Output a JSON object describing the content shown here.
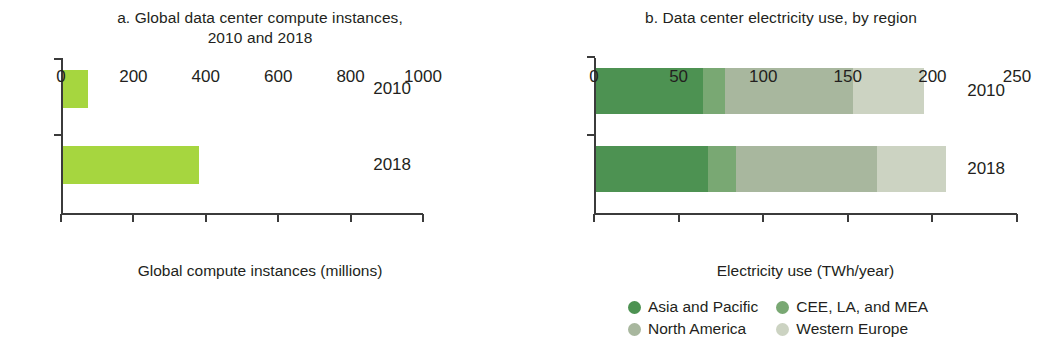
{
  "chart_data": [
    {
      "type": "bar",
      "panel": "a",
      "title": "a. Global data center compute instances,\n2010 and 2018",
      "orientation": "horizontal",
      "categories": [
        "2010",
        "2018"
      ],
      "values": [
        68,
        375
      ],
      "series_name": "Global compute instances",
      "color": "#a6d63f",
      "xlabel": "Global compute instances (millions)",
      "ylabel": "",
      "xlim": [
        0,
        1000
      ],
      "xticks": [
        0,
        200,
        400,
        600,
        800,
        1000
      ],
      "xtick_labels": [
        "0",
        "200",
        "400",
        "600",
        "800",
        "1000"
      ],
      "grid": false,
      "legend": false
    },
    {
      "type": "bar",
      "panel": "b",
      "title": "b. Data center electricity use, by region",
      "orientation": "horizontal",
      "stacked": true,
      "categories": [
        "2010",
        "2018"
      ],
      "series": [
        {
          "name": "Asia and Pacific",
          "values": [
            63,
            66
          ],
          "color": "#4d9252"
        },
        {
          "name": "CEE, LA, and MEA",
          "values": [
            13,
            17
          ],
          "color": "#79a873"
        },
        {
          "name": "North America",
          "values": [
            76,
            83
          ],
          "color": "#a8b79e"
        },
        {
          "name": "Western Europe",
          "values": [
            42,
            41
          ],
          "color": "#ccd3c2"
        }
      ],
      "totals": [
        194,
        207
      ],
      "xlabel": "Electricity use (TWh/year)",
      "ylabel": "",
      "xlim": [
        0,
        250
      ],
      "xticks": [
        0,
        50,
        100,
        150,
        200,
        250
      ],
      "xtick_labels": [
        "0",
        "50",
        "100",
        "150",
        "200",
        "250"
      ],
      "grid": false,
      "legend": true,
      "legend_position": "bottom",
      "legend_entries": [
        "Asia and Pacific",
        "CEE, LA, and MEA",
        "North America",
        "Western Europe"
      ]
    }
  ],
  "panel_a": {
    "title": "a. Global data center compute instances,\n2010 and 2018",
    "axis_title": "Global compute instances (millions)",
    "category_labels": [
      "2010",
      "2018"
    ],
    "tick_labels": [
      "0",
      "200",
      "400",
      "600",
      "800",
      "1000"
    ]
  },
  "panel_b": {
    "title": "b. Data center electricity use, by region",
    "axis_title": "Electricity use (TWh/year)",
    "category_labels": [
      "2010",
      "2018"
    ],
    "tick_labels": [
      "0",
      "50",
      "100",
      "150",
      "200",
      "250"
    ],
    "legend": [
      {
        "label": "Asia and Pacific",
        "color": "#4d9252"
      },
      {
        "label": "CEE, LA, and MEA",
        "color": "#79a873"
      },
      {
        "label": "North America",
        "color": "#a8b79e"
      },
      {
        "label": "Western Europe",
        "color": "#ccd3c2"
      }
    ]
  }
}
